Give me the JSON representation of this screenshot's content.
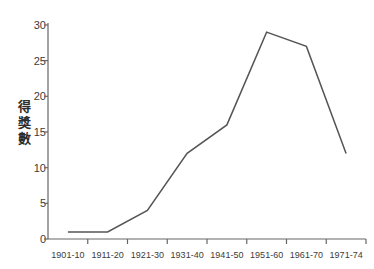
{
  "chart_data": {
    "type": "line",
    "title": "",
    "subtitle": "",
    "xlabel": "",
    "ylabel": "得獎數",
    "categories": [
      "1901-10",
      "1911-20",
      "1921-30",
      "1931-40",
      "1941-50",
      "1951-60",
      "1961-70",
      "1971-74"
    ],
    "values": [
      1,
      1,
      4,
      12,
      16,
      29,
      27,
      12
    ],
    "series": [
      {
        "name": "得獎數",
        "values": [
          1,
          1,
          4,
          12,
          16,
          29,
          27,
          12
        ]
      }
    ],
    "ylim": [
      0,
      30
    ],
    "yticks": [
      0,
      5,
      10,
      15,
      20,
      25,
      30
    ],
    "ytick_labels": [
      "0",
      "5",
      "10",
      "15",
      "20",
      "25",
      "30"
    ],
    "grid": false,
    "legend": false,
    "legend_position": "none",
    "line_color": "#555555",
    "axis_color": "#666666",
    "background_color": "#ffffff",
    "annotations": []
  },
  "axis": {
    "y_title_chars": [
      "得",
      "獎",
      "數"
    ]
  }
}
